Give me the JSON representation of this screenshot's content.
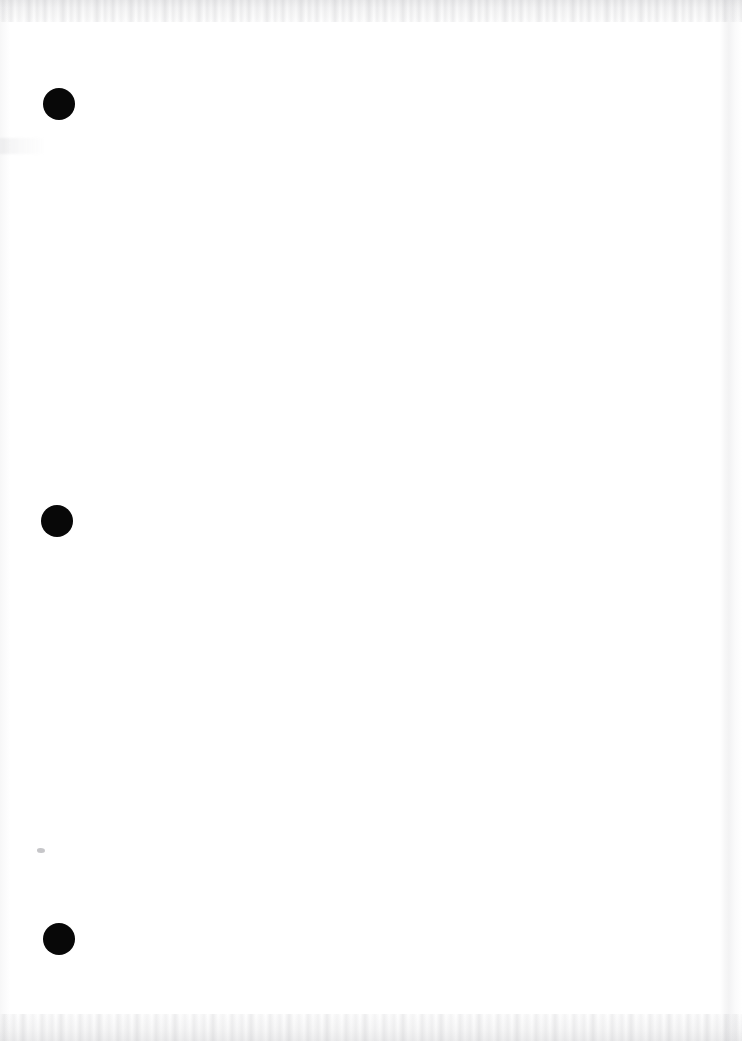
{
  "document": {
    "kind": "scanned-page",
    "page_label": "",
    "body_text": "",
    "description": "Blank scanned page with three black circular ink marks in the left margin",
    "background_color": "#ffffff",
    "ink_color": "#080808",
    "noise_color": "#aaaab0",
    "width": 742,
    "height": 1041
  },
  "marks": [
    {
      "name": "ink-dot-1",
      "shape": "filled-circle",
      "color": "#080808",
      "center_x": 59,
      "center_y": 104,
      "radius": 16,
      "label": ""
    },
    {
      "name": "ink-dot-2",
      "shape": "filled-circle",
      "color": "#080808",
      "center_x": 57,
      "center_y": 521,
      "radius": 16,
      "label": ""
    },
    {
      "name": "ink-dot-3",
      "shape": "filled-circle",
      "color": "#080808",
      "center_x": 59,
      "center_y": 939,
      "radius": 16,
      "label": ""
    }
  ],
  "artifacts": [
    {
      "name": "smudge-speck",
      "center_x": 41,
      "center_y": 850,
      "width": 8,
      "height": 5,
      "color": "#787880",
      "label": ""
    },
    {
      "name": "edge-noise-top",
      "label": ""
    },
    {
      "name": "edge-noise-bottom",
      "label": ""
    },
    {
      "name": "edge-streak-right",
      "label": ""
    },
    {
      "name": "edge-streak-left",
      "label": ""
    }
  ]
}
